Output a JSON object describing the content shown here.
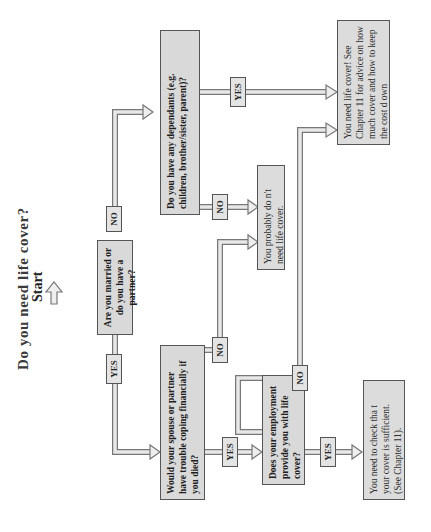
{
  "title": "Do you need life cover?",
  "start_label": "Start",
  "nodes": {
    "married": {
      "text": "Are you married or do you have a partner?"
    },
    "spouse": {
      "text": "Would your spouse or partner have trouble coping financially if you died?"
    },
    "dependants": {
      "text": "Do you have any dependants (e.g. children, brother/sister, parent)?"
    },
    "no_need": {
      "text": "You probably do n't need life cover."
    },
    "employment": {
      "text": "Does your employment provide you with life cover?"
    },
    "need_cover": {
      "text": "You need life cover! See Chapter 11 for advice on how much cover and how to keep the cost d own"
    },
    "check_cover": {
      "text": "You need to check tha t your cover is sufficient. (See Chapter 11)."
    }
  },
  "edge_labels": {
    "married_no": "NO",
    "married_yes": "YES",
    "dependants_yes": "YES",
    "dependants_no": "NO",
    "spouse_no": "NO",
    "spouse_yes": "YES",
    "employment_no": "NO",
    "employment_yes": "YES"
  },
  "colors": {
    "box_fill": "#d9d9d9",
    "box_border": "#555555",
    "arrow_fill": "#e6e6e6",
    "arrow_stroke": "#777777"
  }
}
